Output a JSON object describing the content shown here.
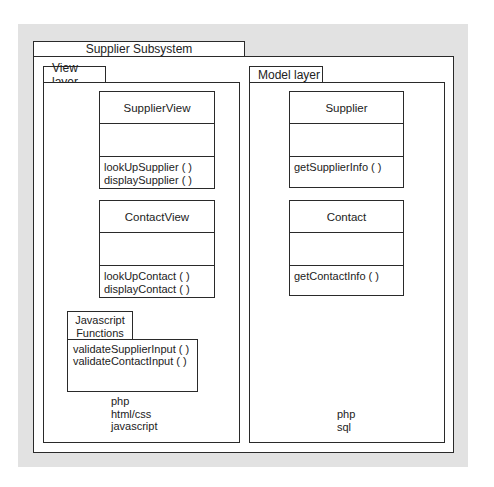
{
  "diagram": {
    "subsystem": {
      "title": "Supplier Subsystem"
    },
    "view_layer": {
      "title": "View layer",
      "classes": [
        {
          "name": "SupplierView",
          "attributes": [],
          "operations": [
            "lookUpSupplier ( )",
            "displaySupplier ( )"
          ]
        },
        {
          "name": "ContactView",
          "attributes": [],
          "operations": [
            "lookUpContact ( )",
            "displayContact ( )"
          ]
        }
      ],
      "package": {
        "title_line1": "Javascript",
        "title_line2": "Functions",
        "items": [
          "validateSupplierInput ( )",
          "validateContactInput ( )"
        ]
      },
      "technologies": [
        "php",
        "html/css",
        "javascript"
      ]
    },
    "model_layer": {
      "title": "Model layer",
      "classes": [
        {
          "name": "Supplier",
          "attributes": [],
          "operations": [
            "getSupplierInfo ( )"
          ]
        },
        {
          "name": "Contact",
          "attributes": [],
          "operations": [
            "getContactInfo ( )"
          ]
        }
      ],
      "technologies": [
        "php",
        "sql"
      ]
    }
  },
  "colors": {
    "background_panel": "#e2e2e2",
    "line": "#2a2a2a",
    "box_fill": "#ffffff"
  }
}
